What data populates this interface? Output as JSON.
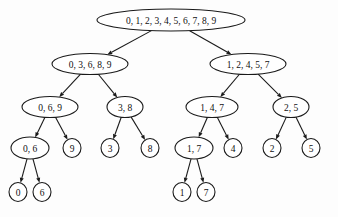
{
  "diagram": {
    "type": "tree",
    "background_color": "#fdfdfd",
    "node_fill": "#ffffff",
    "node_stroke": "#1a1a1a",
    "edge_color": "#1a1a1a",
    "text_color": "#111111"
  },
  "nodes": [
    {
      "id": "n0",
      "label": "0, 1, 2, 3, 4, 5, 6, 7, 8, 9",
      "cx": 171,
      "cy": 20,
      "rx": 74,
      "ry": 11,
      "font_size": 9.5,
      "level": 0
    },
    {
      "id": "n1",
      "label": "0, 3, 6, 8, 9",
      "cx": 90,
      "cy": 64,
      "rx": 38,
      "ry": 10.5,
      "font_size": 9.5,
      "level": 1
    },
    {
      "id": "n2",
      "label": "1, 2, 4, 5, 7",
      "cx": 248,
      "cy": 64,
      "rx": 38,
      "ry": 10.5,
      "font_size": 9.5,
      "level": 1
    },
    {
      "id": "n3",
      "label": "0, 6, 9",
      "cx": 50,
      "cy": 107,
      "rx": 28,
      "ry": 10.5,
      "font_size": 9.5,
      "level": 2
    },
    {
      "id": "n4",
      "label": "3, 8",
      "cx": 125,
      "cy": 107,
      "rx": 18,
      "ry": 10.5,
      "font_size": 9.5,
      "level": 2
    },
    {
      "id": "n5",
      "label": "1, 4, 7",
      "cx": 212,
      "cy": 107,
      "rx": 26,
      "ry": 10.5,
      "font_size": 9.5,
      "level": 2
    },
    {
      "id": "n6",
      "label": "2, 5",
      "cx": 291,
      "cy": 107,
      "rx": 18,
      "ry": 10.5,
      "font_size": 9.5,
      "level": 2
    },
    {
      "id": "n7",
      "label": "0, 6",
      "cx": 30,
      "cy": 148,
      "rx": 19,
      "ry": 11,
      "font_size": 9.5,
      "level": 3
    },
    {
      "id": "n8",
      "label": "9",
      "cx": 72,
      "cy": 148,
      "rx": 9,
      "ry": 9.5,
      "font_size": 9.5,
      "level": 3
    },
    {
      "id": "n9",
      "label": "3",
      "cx": 110,
      "cy": 148,
      "rx": 9,
      "ry": 9.5,
      "font_size": 9.5,
      "level": 3
    },
    {
      "id": "n10",
      "label": "8",
      "cx": 150,
      "cy": 148,
      "rx": 9,
      "ry": 9.5,
      "font_size": 9.5,
      "level": 3
    },
    {
      "id": "n11",
      "label": "1, 7",
      "cx": 194,
      "cy": 148,
      "rx": 19,
      "ry": 11,
      "font_size": 9.5,
      "level": 3
    },
    {
      "id": "n12",
      "label": "4",
      "cx": 233,
      "cy": 148,
      "rx": 9,
      "ry": 9.5,
      "font_size": 9.5,
      "level": 3
    },
    {
      "id": "n13",
      "label": "2",
      "cx": 272,
      "cy": 148,
      "rx": 9,
      "ry": 9.5,
      "font_size": 9.5,
      "level": 3
    },
    {
      "id": "n14",
      "label": "5",
      "cx": 311,
      "cy": 148,
      "rx": 9,
      "ry": 9.5,
      "font_size": 9.5,
      "level": 3
    },
    {
      "id": "n15",
      "label": "0",
      "cx": 18,
      "cy": 192,
      "rx": 9,
      "ry": 9.5,
      "font_size": 9.5,
      "level": 4
    },
    {
      "id": "n16",
      "label": "6",
      "cx": 42,
      "cy": 192,
      "rx": 9,
      "ry": 9.5,
      "font_size": 9.5,
      "level": 4
    },
    {
      "id": "n17",
      "label": "1",
      "cx": 182,
      "cy": 192,
      "rx": 9,
      "ry": 9.5,
      "font_size": 9.5,
      "level": 4
    },
    {
      "id": "n18",
      "label": "7",
      "cx": 206,
      "cy": 192,
      "rx": 9,
      "ry": 9.5,
      "font_size": 9.5,
      "level": 4
    }
  ],
  "edges": [
    {
      "from": "n0",
      "to": "n1"
    },
    {
      "from": "n0",
      "to": "n2"
    },
    {
      "from": "n1",
      "to": "n3"
    },
    {
      "from": "n1",
      "to": "n4"
    },
    {
      "from": "n2",
      "to": "n5"
    },
    {
      "from": "n2",
      "to": "n6"
    },
    {
      "from": "n3",
      "to": "n7"
    },
    {
      "from": "n3",
      "to": "n8"
    },
    {
      "from": "n4",
      "to": "n9"
    },
    {
      "from": "n4",
      "to": "n10"
    },
    {
      "from": "n5",
      "to": "n11"
    },
    {
      "from": "n5",
      "to": "n12"
    },
    {
      "from": "n6",
      "to": "n13"
    },
    {
      "from": "n6",
      "to": "n14"
    },
    {
      "from": "n7",
      "to": "n15"
    },
    {
      "from": "n7",
      "to": "n16"
    },
    {
      "from": "n11",
      "to": "n17"
    },
    {
      "from": "n11",
      "to": "n18"
    }
  ]
}
